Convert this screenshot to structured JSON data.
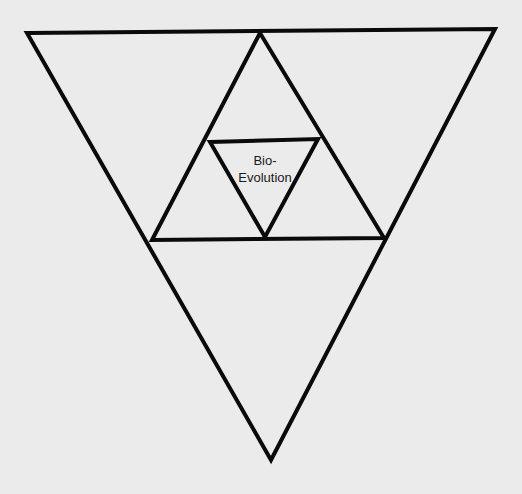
{
  "diagram": {
    "background_color": "#ebebeb",
    "stroke_color": "#0a0a0a",
    "stroke_width": 4,
    "triangles": [
      {
        "name": "outer",
        "points": "27,33 495,29 271,460"
      },
      {
        "name": "middle",
        "points": "260,33 152,240 384,238"
      },
      {
        "name": "inner",
        "points": "210,142 318,139 265,237"
      }
    ],
    "center_label": {
      "line1": "Bio-",
      "line2": "Evolution"
    }
  }
}
